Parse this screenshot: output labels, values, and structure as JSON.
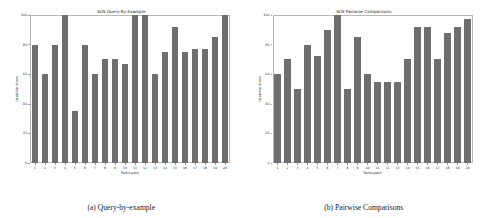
{
  "figure": {
    "subfigures": [
      {
        "caption": "(a) Query-by-example",
        "chart_data": {
          "type": "bar",
          "title": "SUS Query-By-Example",
          "xlabel": "Participant",
          "ylabel": "Usability Score",
          "categories": [
            "1",
            "2",
            "3",
            "4",
            "5",
            "6",
            "7",
            "8",
            "9",
            "10",
            "11",
            "12",
            "13",
            "14",
            "15",
            "16",
            "17",
            "18",
            "19",
            "20"
          ],
          "values": [
            80,
            60,
            80,
            100,
            35,
            80,
            60,
            70,
            70,
            67,
            100,
            100,
            60,
            75,
            92,
            75,
            77,
            77,
            85,
            100
          ],
          "ylim": [
            0,
            100
          ],
          "yticks": [
            0,
            20,
            40,
            60,
            80,
            100
          ],
          "ytick_labels": [
            "0",
            "20",
            "40",
            "60",
            "80",
            "100"
          ],
          "grid": false,
          "legend": "none",
          "bar_color": "#6e6e6e"
        }
      },
      {
        "caption": "(b) Pairwise Comparisons",
        "chart_data": {
          "type": "bar",
          "title": "SUS Pairwise Comparisons",
          "xlabel": "Participant",
          "ylabel": "Usability Score",
          "categories": [
            "1",
            "2",
            "3",
            "4",
            "5",
            "6",
            "7",
            "8",
            "9",
            "10",
            "11",
            "12",
            "13",
            "14",
            "15",
            "16",
            "17",
            "18",
            "19",
            "20"
          ],
          "values": [
            60,
            70,
            50,
            80,
            72,
            90,
            100,
            50,
            85,
            60,
            55,
            55,
            55,
            70,
            92,
            92,
            70,
            88,
            92,
            97
          ],
          "ylim": [
            0,
            100
          ],
          "yticks": [
            0,
            20,
            40,
            60,
            80,
            100
          ],
          "ytick_labels": [
            "0",
            "20",
            "40",
            "60",
            "80",
            "100"
          ],
          "grid": false,
          "legend": "none",
          "bar_color": "#6e6e6e"
        }
      }
    ]
  }
}
